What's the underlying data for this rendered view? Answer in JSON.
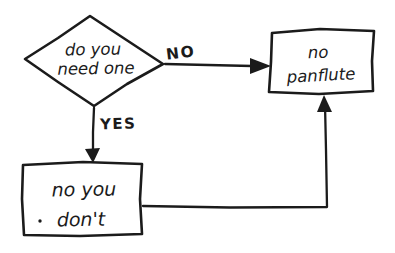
{
  "diagram": {
    "decision": {
      "line1": "do you",
      "line2": "need one"
    },
    "edge_labels": {
      "no": "NO",
      "yes": "YES"
    },
    "result_box": {
      "line1": "no",
      "line2": "panflute"
    },
    "yes_box": {
      "line1": "no you",
      "line2": "don't"
    },
    "colors": {
      "ink": "#1b1b1b",
      "background": "#ffffff"
    }
  }
}
